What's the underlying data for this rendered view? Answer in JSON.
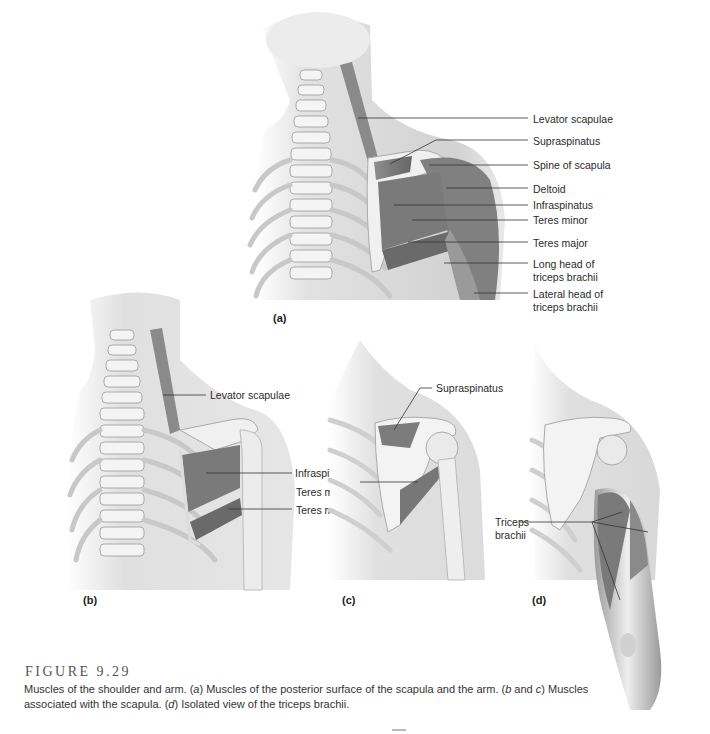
{
  "figure": {
    "number": "FIGURE 9.29",
    "caption": {
      "part1": "Muscles of the shoulder and arm. (",
      "a": "a",
      "part2": ") Muscles of the posterior surface of the scapula and the arm. (",
      "b": "b",
      "part3": " and ",
      "c": "c",
      "part4": ") Muscles associated with the scapula. (",
      "d": "d",
      "part5": ") Isolated view of the triceps brachii."
    }
  },
  "panels": {
    "a": {
      "label": "(a)",
      "labels": [
        "Levator scapulae",
        "Supraspinatus",
        "Spine of scapula",
        "Deltoid",
        "Infraspinatus",
        "Teres minor",
        "Teres major",
        "Long head of",
        "triceps brachii",
        "Lateral head of",
        "triceps brachii"
      ]
    },
    "b": {
      "label": "(b)",
      "labels": [
        "Levator scapulae",
        "Infraspinatus",
        "Teres minor",
        "Teres major"
      ]
    },
    "c": {
      "label": "(c)",
      "labels": [
        "Supraspinatus"
      ]
    },
    "d": {
      "label": "(d)",
      "labels": [
        "Triceps",
        "brachii"
      ]
    }
  },
  "colors": {
    "muscle": "#7a7a7a",
    "bone": "#f2f2f2",
    "skin": "#d6d6d6",
    "leader": "#333333"
  }
}
